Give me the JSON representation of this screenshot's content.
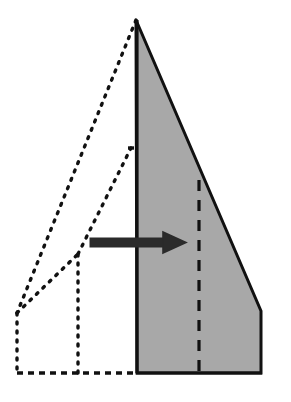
{
  "figure": {
    "kind": "origami-fold-diagram",
    "canvas": {
      "width": 291,
      "height": 402
    },
    "background_color": "#ffffff"
  },
  "colors": {
    "paper_fill": "#a8a8a8",
    "outline_stroke": "#111111",
    "ghost_stroke": "#111111",
    "crease_stroke": "#111111",
    "arrow_fill": "#2b2b2b",
    "arrow_stroke": "#2b2b2b"
  },
  "strokes": {
    "outline_width": 3,
    "ghost_width": 3.4,
    "ghost_dash": "2 7",
    "crease_width": 3.2,
    "crease_dash": "11 9",
    "hinge_width": 3.2,
    "hinge_dash": "6 5"
  },
  "shapes": {
    "folded_panel": {
      "label": "folded-gray-panel",
      "points": "136,20 261,311 261,373 137,373",
      "fill": "#a8a8a8",
      "note": "Solid shaded body of the folded model with beveled lower right corner"
    },
    "spine": {
      "label": "model-spine",
      "x1": 137,
      "y1": 20,
      "x2": 137,
      "y2": 373
    },
    "baseline": {
      "label": "model-baseline",
      "x1": 137,
      "y1": 373,
      "x2": 261,
      "y2": 373
    },
    "interior_crease": {
      "label": "interior-vertical-crease",
      "x1": 199,
      "y1": 180,
      "x2": 199,
      "y2": 373
    }
  },
  "ghost": {
    "label": "ghost-outline-before-fold",
    "apex": {
      "x": 136,
      "y": 20
    },
    "left_vertex": {
      "x": 17,
      "y": 313
    },
    "mid_vertex": {
      "x": 78,
      "y": 254
    },
    "crease_top": {
      "x": 131,
      "y": 148
    },
    "segments": [
      {
        "name": "ghost-apex-to-left-vertex",
        "points": "136,20 17,313"
      },
      {
        "name": "ghost-left-vertex-to-mid",
        "points": "17,313 78,254"
      },
      {
        "name": "ghost-mid-to-crease-top",
        "points": "78,254 131,148"
      },
      {
        "name": "ghost-crease-tick",
        "points": "128,148 137,148"
      },
      {
        "name": "ghost-left-edge-vertical",
        "points": "17,313 17,373"
      },
      {
        "name": "ghost-mid-vertical",
        "points": "78,254 78,373"
      },
      {
        "name": "ghost-bottom-edge",
        "points": "17,373 137,373"
      }
    ]
  },
  "arrow": {
    "label": "fold-direction-arrow",
    "direction": "right",
    "shaft": {
      "x": 90,
      "y": 238,
      "width": 76,
      "height": 9
    },
    "head": {
      "points": "163,232 186,242.5 163,253"
    },
    "tip": {
      "x": 186,
      "y": 242.5
    }
  }
}
